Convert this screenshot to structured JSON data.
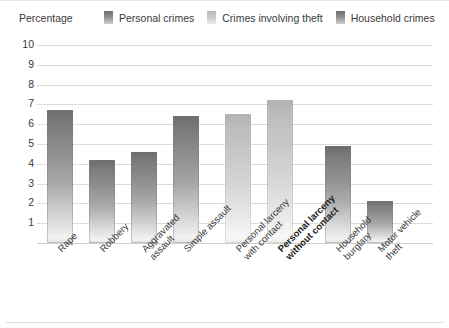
{
  "axis": {
    "y_title": "Percentage",
    "y_ticks": [
      "10",
      "9",
      "8",
      "7",
      "6",
      "5",
      "4",
      "3",
      "2",
      "1"
    ]
  },
  "legend": {
    "items": [
      {
        "label": "Personal crimes",
        "swatch": "personal-crimes-swatch",
        "color": "#8c8c8c"
      },
      {
        "label": "Crimes involving theft",
        "swatch": "crimes-involving-theft-swatch",
        "color": "#c9c9c9"
      },
      {
        "label": "Household crimes",
        "swatch": "household-crimes-swatch",
        "color": "#8c8c8c"
      }
    ]
  },
  "categories": [
    {
      "line1": "Rape",
      "line2": "",
      "bold": false
    },
    {
      "line1": "Robbery",
      "line2": "",
      "bold": false
    },
    {
      "line1": "Aggravated",
      "line2": "assault",
      "bold": false
    },
    {
      "line1": "Simple assault",
      "line2": "",
      "bold": false
    },
    {
      "line1": "Personal larceny",
      "line2": "with contact",
      "bold": false
    },
    {
      "line1": "Personal larceny",
      "line2": "without contact",
      "bold": true
    },
    {
      "line1": "Household",
      "line2": "burglary",
      "bold": false
    },
    {
      "line1": "Motor vehicle",
      "line2": "theft",
      "bold": false
    }
  ],
  "chart_data": {
    "type": "bar",
    "title": "",
    "xlabel": "",
    "ylabel": "Percentage",
    "ylim": [
      0,
      10
    ],
    "yticks": [
      1,
      2,
      3,
      4,
      5,
      6,
      7,
      8,
      9,
      10
    ],
    "grid": true,
    "legend_position": "top",
    "categories": [
      "Rape",
      "Robbery",
      "Aggravated assault",
      "Simple assault",
      "Personal larceny with contact",
      "Personal larceny without contact",
      "Household burglary",
      "Motor vehicle theft"
    ],
    "series": [
      {
        "name": "Personal crimes",
        "values": [
          6.7,
          4.2,
          4.6,
          6.4,
          null,
          null,
          null,
          null
        ]
      },
      {
        "name": "Crimes involving theft",
        "values": [
          null,
          null,
          null,
          null,
          6.5,
          7.2,
          null,
          null
        ]
      },
      {
        "name": "Household crimes",
        "values": [
          null,
          null,
          null,
          null,
          null,
          null,
          4.9,
          2.1
        ]
      }
    ],
    "values": [
      6.7,
      4.2,
      4.6,
      6.4,
      6.5,
      7.2,
      4.9,
      2.1
    ],
    "group_of": [
      "personal",
      "personal",
      "personal",
      "personal",
      "theft",
      "theft",
      "household",
      "household"
    ]
  }
}
